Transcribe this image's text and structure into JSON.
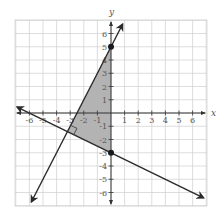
{
  "chart_data": {
    "type": "line",
    "title": "",
    "xlabel": "x",
    "ylabel": "y",
    "xlim": [
      -7,
      7
    ],
    "ylim": [
      -7,
      7
    ],
    "grid": true,
    "x_ticks": [
      -6,
      -5,
      -4,
      -3,
      -2,
      -1,
      1,
      2,
      3,
      4,
      5,
      6
    ],
    "y_ticks": [
      -6,
      -5,
      -4,
      -3,
      -2,
      -1,
      1,
      2,
      3,
      4,
      5,
      6
    ],
    "series": [
      {
        "name": "line 1",
        "equation": "y = 2x + 5",
        "slope": 2,
        "intercept": 5,
        "x": [
          -5.85,
          0.85
        ],
        "y": [
          -6.7,
          6.7
        ]
      },
      {
        "name": "line 2",
        "equation": "y = -0.5x - 3",
        "slope": -0.5,
        "intercept": -3,
        "x": [
          -6.9,
          6.8
        ],
        "y": [
          0.45,
          -6.4
        ]
      }
    ],
    "points": [
      {
        "x": 0,
        "y": 5
      },
      {
        "x": 0,
        "y": -3
      }
    ],
    "shaded_region": {
      "vertices": [
        [
          0,
          5
        ],
        [
          0,
          -3
        ],
        [
          -3.2,
          -1.4
        ]
      ],
      "color": "#b3b3b3"
    },
    "annotations": [
      {
        "type": "right-angle-marker",
        "at": [
          -3.2,
          -1.4
        ]
      }
    ]
  },
  "labels": {
    "x_axis": "x",
    "y_axis": "y",
    "x_ticks": [
      "-6",
      "-5",
      "-4",
      "-3",
      "-2",
      "-1",
      "1",
      "2",
      "3",
      "4",
      "5",
      "6"
    ],
    "y_ticks": [
      "6",
      "5",
      "4",
      "3",
      "2",
      "1",
      "-1",
      "-2",
      "-3",
      "-4",
      "-5",
      "-6"
    ]
  },
  "colors": {
    "grid": "#cfcfcf",
    "axis": "#333333",
    "line": "#2a2a2a",
    "shade": "#b3b3b3"
  }
}
